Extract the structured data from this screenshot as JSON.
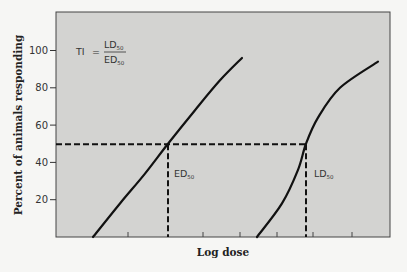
{
  "chart_data": {
    "type": "line",
    "title": "",
    "xlabel": "Log dose",
    "ylabel": "Percent of animals responding",
    "ylim": [
      0,
      100
    ],
    "yticks": [
      20,
      40,
      60,
      80,
      100
    ],
    "ytick_labels": [
      "20",
      "40",
      "60",
      "80",
      "100"
    ],
    "x_ticks_unlabeled": 6,
    "grid": false,
    "legend": null,
    "series": [
      {
        "name": "Therapeutic effect (ED curve)",
        "x_px": [
          93,
          120,
          145,
          168,
          195,
          220,
          242
        ],
        "y_pct": [
          0,
          18,
          34,
          50,
          68,
          84,
          96
        ]
      },
      {
        "name": "Lethal effect (LD curve)",
        "x_px": [
          257,
          282,
          298,
          306,
          318,
          340,
          378
        ],
        "y_pct": [
          0,
          18,
          36,
          50,
          64,
          80,
          94
        ]
      }
    ],
    "reference_line_y": 50,
    "annotations": {
      "formula": {
        "lhs": "TI",
        "eq": "=",
        "numerator": "LD",
        "numerator_sub": "50",
        "denominator": "ED",
        "denominator_sub": "50"
      },
      "ed50": {
        "label": "ED",
        "sub": "50"
      },
      "ld50": {
        "label": "LD",
        "sub": "50"
      }
    }
  },
  "colors": {
    "plot_bg": "#d3d3d1",
    "page_bg": "#f6f6f4",
    "ink": "#111111"
  }
}
